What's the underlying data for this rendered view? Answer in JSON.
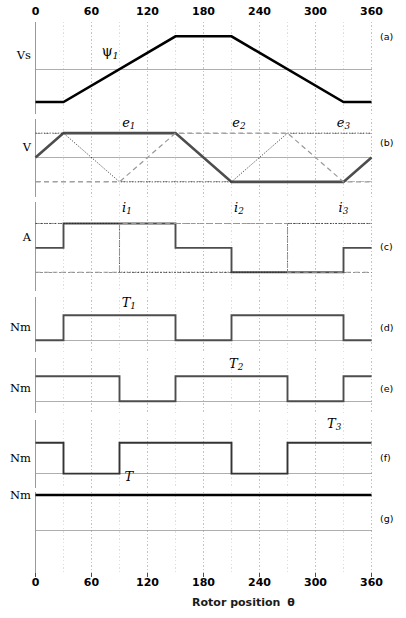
{
  "figure": {
    "x_axis": {
      "label": "Rotor position",
      "symbol": "θ",
      "ticks": [
        0,
        60,
        120,
        180,
        240,
        300,
        360
      ],
      "tick_labels": [
        "0",
        "60",
        "120",
        "180",
        "240",
        "300",
        "360"
      ],
      "min": 0,
      "max": 360,
      "minor_step": 30
    },
    "caption": "",
    "panels": [
      {
        "tag": "(a)",
        "unit": "Vs",
        "annotations": [
          {
            "text": "ψ",
            "sub": "1",
            "x": 80,
            "y": 0.52,
            "style": "psi"
          }
        ]
      },
      {
        "tag": "(b)",
        "unit": "V",
        "annotations": [
          {
            "text": "e",
            "sub": "1",
            "x": 100,
            "y": 1.42
          },
          {
            "text": "e",
            "sub": "2",
            "x": 218,
            "y": 1.42
          },
          {
            "text": "e",
            "sub": "3",
            "x": 330,
            "y": 1.42
          }
        ]
      },
      {
        "tag": "(c)",
        "unit": "A",
        "annotations": [
          {
            "text": "i",
            "sub": "1",
            "x": 98,
            "y": 1.62
          },
          {
            "text": "i",
            "sub": "2",
            "x": 218,
            "y": 1.62
          },
          {
            "text": "i",
            "sub": "3",
            "x": 330,
            "y": 1.62
          }
        ]
      },
      {
        "tag": "(d)",
        "unit": "Nm",
        "annotations": [
          {
            "text": "T",
            "sub": "1",
            "x": 100,
            "y": 1.5
          }
        ]
      },
      {
        "tag": "(e)",
        "unit": "Nm",
        "annotations": [
          {
            "text": "T",
            "sub": "2",
            "x": 215,
            "y": 1.5
          }
        ]
      },
      {
        "tag": "(f)",
        "unit": "Nm",
        "annotations": [
          {
            "text": "T",
            "sub": "3",
            "x": 320,
            "y": 1.62
          }
        ]
      },
      {
        "tag": "(g)",
        "unit": "Nm",
        "annotations": [
          {
            "text": "T",
            "sub": "",
            "x": 100,
            "y": 1.55
          }
        ]
      }
    ]
  },
  "chart_data": {
    "type": "line",
    "title": "",
    "xlabel": "Rotor position θ",
    "xlim": [
      0,
      360
    ],
    "xticks": [
      0,
      60,
      120,
      180,
      240,
      300,
      360
    ],
    "grid": true,
    "subplots": [
      {
        "id": "a",
        "ylabel": "Vs",
        "ylim": [
          -1.35,
          1.45
        ],
        "series": [
          {
            "name": "psi_1",
            "style": "solid-heavy",
            "color": "#000000",
            "x": [
              0,
              30,
              150,
              210,
              330,
              360
            ],
            "y": [
              -1,
              -1,
              1,
              1,
              -1,
              -1
            ]
          }
        ]
      },
      {
        "id": "b",
        "ylabel": "V",
        "ylim": [
          -1.6,
          1.6
        ],
        "series": [
          {
            "name": "e_1",
            "style": "solid-heavy",
            "color": "#4d4d4d",
            "x": [
              0,
              30,
              150,
              210,
              330,
              360
            ],
            "y": [
              0,
              1,
              1,
              -1,
              -1,
              0
            ]
          },
          {
            "name": "e_2",
            "style": "dotted-thin",
            "color": "#1a1a1a",
            "x": [
              0,
              30,
              90,
              210,
              270,
              360
            ],
            "y": [
              1,
              1,
              -1,
              -1,
              1,
              1
            ]
          },
          {
            "name": "e_3",
            "style": "dashed-gray",
            "color": "#999999",
            "x": [
              0,
              90,
              150,
              270,
              330,
              360
            ],
            "y": [
              -1,
              -1,
              1,
              1,
              -1,
              -1
            ]
          }
        ]
      },
      {
        "id": "c",
        "ylabel": "A",
        "ylim": [
          -1.75,
          1.9
        ],
        "series": [
          {
            "name": "i_1",
            "style": "step-heavy",
            "color": "#4d4d4d",
            "x": [
              0,
              30,
              150,
              210,
              330,
              360
            ],
            "y": [
              0,
              1,
              0,
              -1,
              0,
              0
            ]
          },
          {
            "name": "i_2",
            "style": "step-dotted",
            "color": "#1a1a1a",
            "x": [
              0,
              90,
              270,
              360
            ],
            "y": [
              1,
              -1,
              1,
              1
            ]
          },
          {
            "name": "i_3",
            "style": "step-dashed",
            "color": "#999999",
            "x": [
              0,
              90,
              270,
              360
            ],
            "y": [
              -1,
              1,
              -1,
              -1
            ]
          }
        ]
      },
      {
        "id": "d",
        "ylabel": "Nm",
        "ylim": [
          -0.45,
          1.75
        ],
        "series": [
          {
            "name": "T_1",
            "style": "step-heavy",
            "color": "#4d4d4d",
            "x": [
              0,
              30,
              150,
              210,
              330,
              360
            ],
            "y": [
              0,
              1,
              0,
              1,
              0,
              0
            ]
          }
        ]
      },
      {
        "id": "e",
        "ylabel": "Nm",
        "ylim": [
          -0.45,
          1.75
        ],
        "series": [
          {
            "name": "T_2",
            "style": "step-heavy",
            "color": "#4d4d4d",
            "x": [
              0,
              90,
              150,
              270,
              330,
              360
            ],
            "y": [
              1,
              0,
              1,
              0,
              1,
              1
            ]
          }
        ]
      },
      {
        "id": "f",
        "ylabel": "Nm",
        "ylim": [
          -0.45,
          1.75
        ],
        "series": [
          {
            "name": "T_3",
            "style": "step-heavy",
            "color": "#333333",
            "x": [
              0,
              30,
              90,
              210,
              270,
              360
            ],
            "y": [
              1,
              0,
              1,
              0,
              1,
              1
            ]
          }
        ]
      },
      {
        "id": "g",
        "ylabel": "Nm",
        "ylim": [
          -1.2,
          1.1
        ],
        "series": [
          {
            "name": "T",
            "style": "solid-heavy",
            "color": "#000000",
            "x": [
              0,
              360
            ],
            "y": [
              1,
              1
            ]
          }
        ]
      }
    ]
  }
}
